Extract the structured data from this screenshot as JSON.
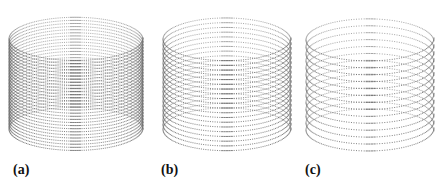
{
  "figure": {
    "panels": [
      {
        "label": "(a)",
        "label_pos": {
          "x": 13,
          "y": 163
        },
        "cylinder": {
          "cx": 76,
          "top": 16,
          "bottom": 150,
          "rx": 67,
          "ry": 22,
          "rings": 30,
          "pitch_tilt": 0.55,
          "dot_gap": 2.2
        }
      },
      {
        "label": "(b)",
        "label_pos": {
          "x": 161,
          "y": 163
        },
        "cylinder": {
          "cx": 227,
          "top": 16,
          "bottom": 150,
          "rx": 64,
          "ry": 22,
          "rings": 20,
          "pitch_tilt": 0.55,
          "dot_gap": 2.4
        }
      },
      {
        "label": "(c)",
        "label_pos": {
          "x": 305,
          "y": 163
        },
        "cylinder": {
          "cx": 370,
          "top": 16,
          "bottom": 150,
          "rx": 64,
          "ry": 22,
          "rings": 14,
          "pitch_tilt": 0.55,
          "dot_gap": 2.6
        }
      }
    ],
    "dot_color": "#6b6b6b"
  }
}
